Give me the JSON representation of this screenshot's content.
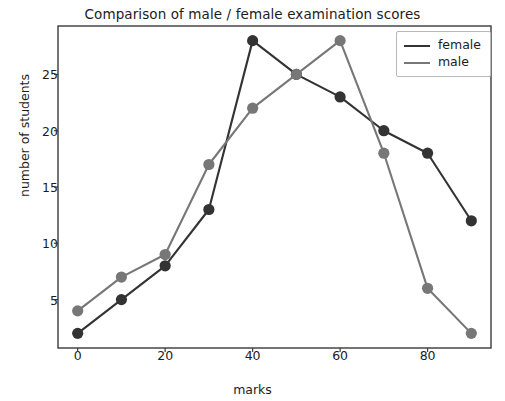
{
  "chart_data": {
    "type": "line",
    "title": "Comparison of male / female examination scores",
    "xlabel": "marks",
    "ylabel": "number of students",
    "x": [
      0,
      10,
      20,
      30,
      40,
      50,
      60,
      70,
      80,
      90
    ],
    "series": [
      {
        "name": "female",
        "color": "#333333",
        "marker": "o",
        "values": [
          2,
          5,
          8,
          13,
          28,
          25,
          23,
          20,
          18,
          12
        ]
      },
      {
        "name": "male",
        "color": "#777777",
        "marker": "o",
        "values": [
          4,
          7,
          9,
          17,
          22,
          25,
          28,
          18,
          6,
          2
        ]
      }
    ],
    "xlim": [
      -4.5,
      94.5
    ],
    "ylim": [
      0.7,
      29.3
    ],
    "xticks": [
      0,
      20,
      40,
      60,
      80
    ],
    "xtick_labels": [
      "0",
      "20",
      "40",
      "60",
      "80"
    ],
    "yticks": [
      5,
      10,
      15,
      20,
      25
    ],
    "ytick_labels": [
      "5",
      "10",
      "15",
      "20",
      "25"
    ],
    "grid": false,
    "legend_position": "upper right",
    "frame_color": "#3a3a3a",
    "background": "#ffffff"
  }
}
